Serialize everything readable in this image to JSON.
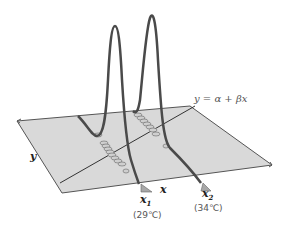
{
  "diagram": {
    "type": "regression-normal-distributions-3d",
    "regression_line_label": "y = α + βx",
    "axis_x_label": "x",
    "axis_y_label": "y",
    "points": [
      {
        "label": "x",
        "subscript": "1",
        "value": "(29℃)"
      },
      {
        "label": "x",
        "subscript": "2",
        "value": "(34℃)"
      }
    ],
    "colors": {
      "plane_fill": "#d9d9d9",
      "plane_edge": "#555555",
      "curve": "#4a4a4a",
      "ellipse_fill": "#cfcfcf",
      "marker": "#a8a8a8"
    }
  }
}
